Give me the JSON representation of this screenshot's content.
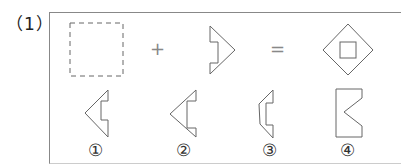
{
  "question": {
    "number_label": "（1）"
  },
  "equation": {
    "operand1": "dashed-square-blank",
    "plus": "+",
    "operand2": "notched-arrow-right-half",
    "equals": "=",
    "result": "diamond-with-inner-square"
  },
  "options": [
    {
      "label": "①",
      "shape": "notched-left-arrow-half-a"
    },
    {
      "label": "②",
      "shape": "notched-left-arrow-half-b"
    },
    {
      "label": "③",
      "shape": "bracket-shape"
    },
    {
      "label": "④",
      "shape": "rectangle-with-v-notch"
    }
  ],
  "colors": {
    "stroke": "#555555",
    "frame": "#888888"
  }
}
